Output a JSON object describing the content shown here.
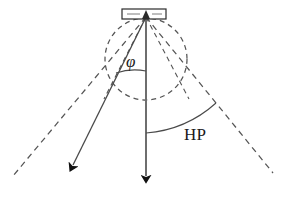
{
  "figure": {
    "labels": {
      "phi": "φ",
      "hp": "HP"
    },
    "colors": {
      "stroke_solid": "#4a4a4a",
      "stroke_dark": "#1a1a1a",
      "stroke_dashed": "#555555",
      "background": "#ffffff",
      "text": "#1a1a1a"
    },
    "elements": {
      "antenna_box": "rectangle",
      "dashed_circle": "circle",
      "boresight_arrow": "arrow-down",
      "beam_arrow": "arrow-down-left",
      "cone_left": "dashed-line",
      "cone_right": "dashed-line",
      "inner_left": "dashed-line",
      "inner_right": "dashed-line",
      "phi_arc": "arc",
      "hp_arc": "arc"
    },
    "geometry": {
      "apex_x": 146,
      "apex_y": 17,
      "circle_cx": 146,
      "circle_cy": 59,
      "circle_r": 41,
      "box_x": 122,
      "box_y": 9,
      "box_w": 44,
      "box_h": 10,
      "vertical_tip_x": 146,
      "vertical_tip_y": 191,
      "beam_tip_x": 68,
      "beam_tip_y": 173,
      "cone_left_end_x": 13,
      "cone_left_end_y": 176,
      "cone_right_end_x": 273,
      "cone_right_end_y": 173,
      "inner_left_end_x": 92,
      "inner_left_end_y": 96,
      "inner_right_end_x": 200,
      "inner_right_end_y": 96
    }
  }
}
